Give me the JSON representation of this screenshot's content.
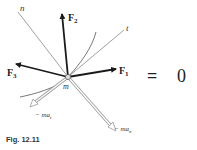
{
  "figure": {
    "caption": "Fig. 12.11",
    "particle_label": "m",
    "axes": {
      "normal": "n",
      "tangent": "t"
    },
    "forces": [
      {
        "name": "F",
        "sub": "1"
      },
      {
        "name": "F",
        "sub": "2"
      },
      {
        "name": "F",
        "sub": "3"
      }
    ],
    "inertia_vectors": [
      {
        "name": "− ma",
        "sub": "t"
      },
      {
        "name": "− ma",
        "sub": "n"
      }
    ],
    "equation": {
      "operator": "=",
      "rhs": "0"
    },
    "colors": {
      "force": "#1a1a1a",
      "axis": "#777777",
      "inertia_outline": "#999999",
      "inertia_fill": "#ffffff"
    }
  }
}
